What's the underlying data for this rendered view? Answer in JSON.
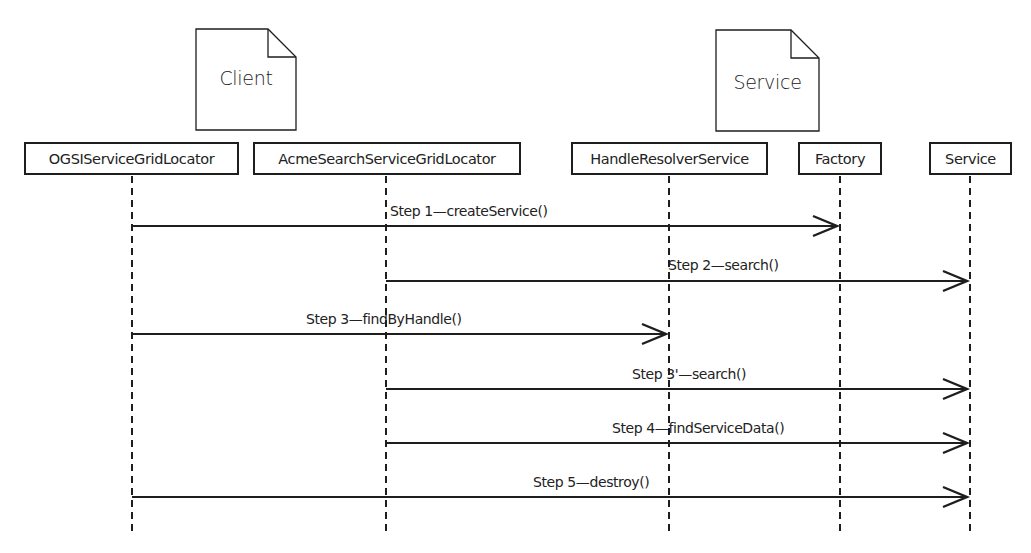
{
  "diagram": {
    "type": "sequence-diagram",
    "groups": [
      {
        "label": "Client",
        "x": 196,
        "y": 29,
        "w": 100,
        "h": 101
      },
      {
        "label": "Service",
        "x": 716,
        "y": 30,
        "w": 103,
        "h": 101
      }
    ],
    "participants": [
      {
        "label": "OGSIServiceGridLocator",
        "box_left": 24,
        "box_width": 215,
        "lifeline_x": 132
      },
      {
        "label": "AcmeSearchServiceGridLocator",
        "box_left": 253,
        "box_width": 268,
        "lifeline_x": 386
      },
      {
        "label": "HandleResolverService",
        "box_left": 571,
        "box_width": 197,
        "lifeline_x": 669
      },
      {
        "label": "Factory",
        "box_left": 798,
        "box_width": 84,
        "lifeline_x": 840
      },
      {
        "label": "Service",
        "box_left": 929,
        "box_width": 83,
        "lifeline_x": 970
      }
    ],
    "messages": [
      {
        "label": "Step 1—createService()",
        "from": 0,
        "to": 3,
        "y": 226,
        "label_x": 390
      },
      {
        "label": "Step 2—search()",
        "from": 1,
        "to": 4,
        "y": 281,
        "label_x": 668
      },
      {
        "label": "Step 3—findByHandle()",
        "from": 0,
        "to": 2,
        "y": 334,
        "label_x": 306
      },
      {
        "label": "Step 3'—search()",
        "from": 1,
        "to": 4,
        "y": 389,
        "label_x": 632
      },
      {
        "label": "Step 4—findServiceData()",
        "from": 1,
        "to": 4,
        "y": 443,
        "label_x": 612
      },
      {
        "label": "Step 5—destroy()",
        "from": 0,
        "to": 4,
        "y": 497,
        "label_x": 533
      }
    ],
    "lifeline_top": 176,
    "lifeline_bottom": 534,
    "colors": {
      "stroke": "#1e1e1e",
      "background": "#ffffff"
    }
  }
}
